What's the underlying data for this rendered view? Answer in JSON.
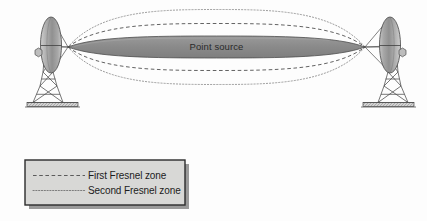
{
  "figure": {
    "background_color": "#fdfdfd"
  },
  "colors": {
    "first_zone_fill": "#8c8c8c",
    "first_zone_stroke": "#3d3d3d",
    "second_zone_stroke": "#6e6e6e",
    "third_zone_stroke": "#8a8a8a",
    "dish_light": "#d6d6d6",
    "dish_mid": "#a5a5a5",
    "dish_dark": "#6f6f6f",
    "tower_stroke": "#4a4a4a",
    "legend_fill": "#d8d8d6",
    "legend_border": "#2b2b2b",
    "legend_shadow": "#9a9a9a",
    "text_dark": "#1c1c1c",
    "label_on_fill": "#2a2a2a"
  },
  "beam": {
    "point_source_label": "Point source",
    "left_focus": {
      "x": 68,
      "y": 47
    },
    "right_focus": {
      "x": 365,
      "y": 47
    },
    "first_zone": {
      "cx": 216.5,
      "cy": 47,
      "rx": 148,
      "ry": 11
    },
    "second_zone": {
      "cx": 216.5,
      "cy": 47,
      "rx": 148,
      "ry": 23
    },
    "third_zone": {
      "cx": 216.5,
      "cy": 47,
      "rx": 148,
      "ry": 37
    }
  },
  "antennas": [
    {
      "name": "left-antenna",
      "side": "left",
      "dish_center": {
        "x": 51,
        "y": 45
      },
      "dish_rx": 10,
      "dish_ry": 28
    },
    {
      "name": "right-antenna",
      "side": "right",
      "dish_center": {
        "x": 390,
        "y": 45
      },
      "dish_rx": 10,
      "dish_ry": 28
    }
  ],
  "legend": {
    "box": {
      "x": 25,
      "y": 160,
      "width": 160,
      "height": 45
    },
    "items": [
      {
        "label": "First Fresnel zone",
        "line_style": "dashed"
      },
      {
        "label": "Second Fresnel zone",
        "line_style": "dotted"
      }
    ]
  }
}
